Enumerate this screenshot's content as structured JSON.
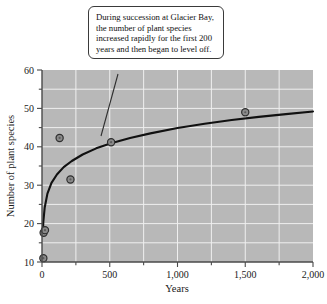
{
  "chart_data": {
    "type": "scatter",
    "title": "",
    "xlabel": "Years",
    "ylabel": "Number of plant species",
    "xlim": [
      0,
      2000
    ],
    "ylim": [
      10,
      60
    ],
    "grid": true,
    "legend": "none",
    "x_ticks": [
      0,
      250,
      500,
      750,
      1000,
      1250,
      1500,
      1750,
      2000
    ],
    "x_tick_labels": [
      "0",
      "",
      "500",
      "",
      "1,000",
      "",
      "1,500",
      "",
      "2,000"
    ],
    "x_major_labels": [
      "0",
      "500",
      "1,000",
      "1,500",
      "2,000"
    ],
    "y_ticks": [
      10,
      15,
      20,
      25,
      30,
      35,
      40,
      45,
      50,
      55,
      60
    ],
    "y_tick_labels": [
      "10",
      "",
      "20",
      "",
      "30",
      "",
      "40",
      "",
      "50",
      "",
      "60"
    ],
    "y_major_labels": [
      "10",
      "20",
      "30",
      "40",
      "50",
      "60"
    ],
    "points": [
      {
        "x": 10,
        "y": 11.0
      },
      {
        "x": 12,
        "y": 17.6
      },
      {
        "x": 22,
        "y": 18.3
      },
      {
        "x": 130,
        "y": 42.3
      },
      {
        "x": 210,
        "y": 31.5
      },
      {
        "x": 510,
        "y": 41.2
      },
      {
        "x": 1500,
        "y": 49.0
      }
    ],
    "series": [
      {
        "name": "fitted logarithmic curve",
        "type": "line",
        "x": [
          5,
          10,
          20,
          40,
          70,
          110,
          160,
          220,
          300,
          400,
          510,
          650,
          800,
          1000,
          1200,
          1400,
          1600,
          1800,
          2000
        ],
        "y": [
          17.0,
          20.6,
          24.2,
          27.8,
          30.6,
          32.8,
          34.7,
          36.3,
          38.0,
          39.6,
          40.9,
          42.3,
          43.5,
          44.9,
          46.0,
          47.0,
          47.8,
          48.5,
          49.2
        ]
      }
    ],
    "annotation": "During succession at Glacier Bay, the number of plant species increased rapidly for the first 200 years and then began to level off."
  },
  "axes": {
    "x_title": "Years",
    "y_title": "Number of plant species",
    "x_labels": [
      "0",
      "500",
      "1,000",
      "1,500",
      "2,000"
    ],
    "y_labels": [
      "60",
      "50",
      "40",
      "30",
      "20",
      "10"
    ]
  },
  "callout": {
    "text": "During succession at Glacier Bay, the number of plant species increased rapidly for the first 200 years and then began to level off."
  },
  "colors": {
    "plot_background": "#b8b8b8",
    "gridline": "#eeeeee",
    "curve": "#111111",
    "marker_fill": "#8a8a8a",
    "marker_stroke": "#2e2e2e",
    "axis": "#4a4a4a",
    "callout_border": "#3a3a3a",
    "callout_background": "#ffffff",
    "text": "#1a1a1a"
  }
}
